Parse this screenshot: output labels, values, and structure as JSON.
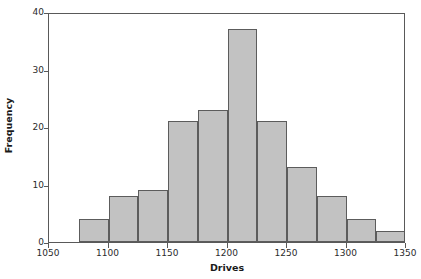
{
  "chart_data": {
    "type": "bar",
    "title": "",
    "xlabel": "Drives",
    "ylabel": "Frequency",
    "xlim": [
      1050,
      1350
    ],
    "ylim": [
      0,
      40
    ],
    "grid": false,
    "legend": null,
    "bin_width": 25,
    "categories": [
      "1075-1100",
      "1100-1125",
      "1125-1150",
      "1150-1175",
      "1175-1200",
      "1200-1225",
      "1225-1250",
      "1250-1275",
      "1275-1300",
      "1300-1325",
      "1325-1350"
    ],
    "bin_edges": [
      1075,
      1100,
      1125,
      1150,
      1175,
      1200,
      1225,
      1250,
      1275,
      1300,
      1325,
      1350
    ],
    "values": [
      4,
      8,
      9,
      21,
      23,
      37,
      21,
      13,
      8,
      4,
      2
    ],
    "xticks": [
      1050,
      1100,
      1150,
      1200,
      1250,
      1300,
      1350
    ],
    "xtick_labels": [
      "1050",
      "1100",
      "1150",
      "1200",
      "1250",
      "1300",
      "1350"
    ],
    "yticks": [
      0,
      10,
      20,
      30,
      40
    ],
    "ytick_labels": [
      "0",
      "10",
      "20",
      "30",
      "40"
    ],
    "bar_fill_color": "#c2c2c2",
    "bar_edge_color": "#5c5c5c",
    "frame_color": "#595959",
    "text_color": "#2b2b2b"
  }
}
